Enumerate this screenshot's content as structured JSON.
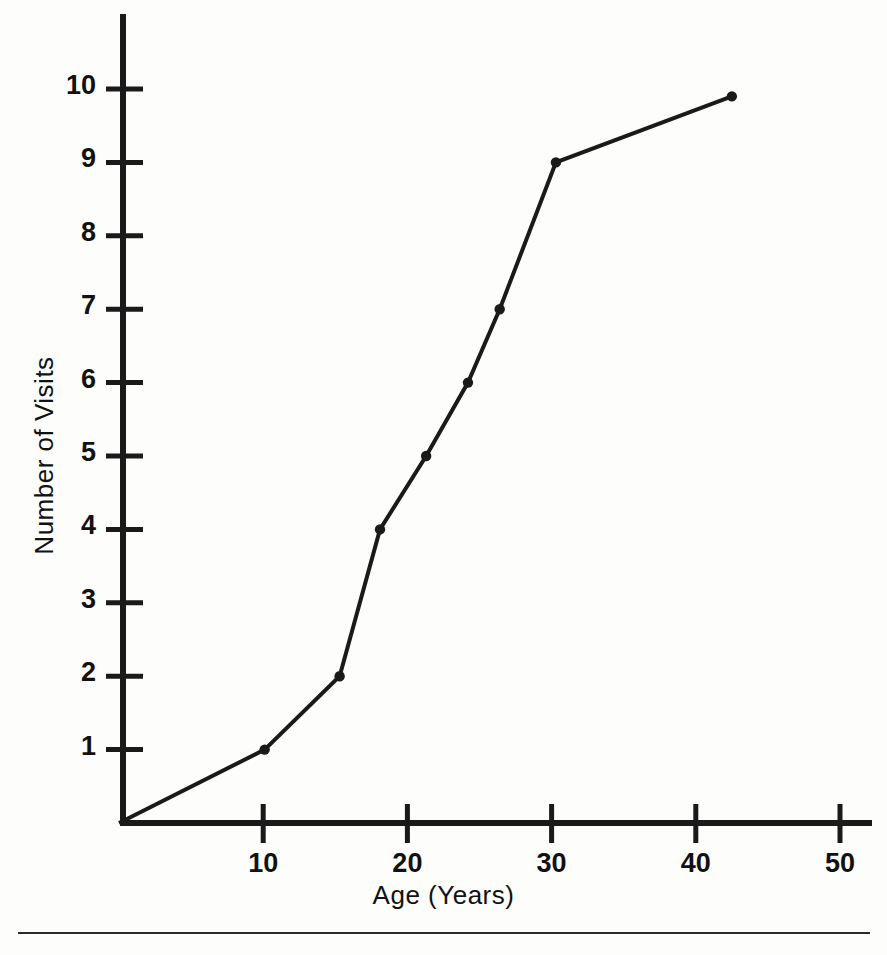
{
  "chart_data": {
    "type": "line",
    "title": "",
    "xlabel": "Age (Years)",
    "ylabel": "Number of Visits",
    "xlim": [
      0,
      52
    ],
    "ylim": [
      0,
      10.6
    ],
    "grid": false,
    "legend": "none",
    "markers": "filled-dot",
    "line_color": "#1a1a1a",
    "marker_color": "#1a1a1a",
    "background_color": "#fdfdfc",
    "xticks": [
      10,
      20,
      30,
      40,
      50
    ],
    "xtick_labels": [
      "10",
      "20",
      "30",
      "40",
      "50"
    ],
    "yticks": [
      1,
      2,
      3,
      4,
      5,
      6,
      7,
      8,
      9,
      10
    ],
    "ytick_labels": [
      "1",
      "2",
      "3",
      "4",
      "5",
      "6",
      "7",
      "8",
      "9",
      "10"
    ],
    "series": [
      {
        "name": "Number of Visits",
        "x": [
          0,
          10.1,
          15.3,
          18.1,
          21.3,
          24.2,
          26.4,
          30.3,
          42.5
        ],
        "y": [
          0,
          1,
          2,
          4,
          5,
          6,
          7,
          9,
          9.9
        ]
      }
    ],
    "points": [
      {
        "age": 0,
        "visits": 0
      },
      {
        "age": 10.1,
        "visits": 1
      },
      {
        "age": 15.3,
        "visits": 2
      },
      {
        "age": 18.1,
        "visits": 4
      },
      {
        "age": 21.3,
        "visits": 5
      },
      {
        "age": 24.2,
        "visits": 6
      },
      {
        "age": 26.4,
        "visits": 7
      },
      {
        "age": 30.3,
        "visits": 9
      },
      {
        "age": 42.5,
        "visits": 9.9
      }
    ]
  },
  "figure": {
    "ylabel": "Number of Visits",
    "xlabel": "Age (Years)",
    "ytick_labels": [
      "10",
      "9",
      "8",
      "7",
      "6",
      "5",
      "4",
      "3",
      "2",
      "1"
    ],
    "xtick_labels": [
      "10",
      "20",
      "30",
      "40",
      "50"
    ]
  }
}
